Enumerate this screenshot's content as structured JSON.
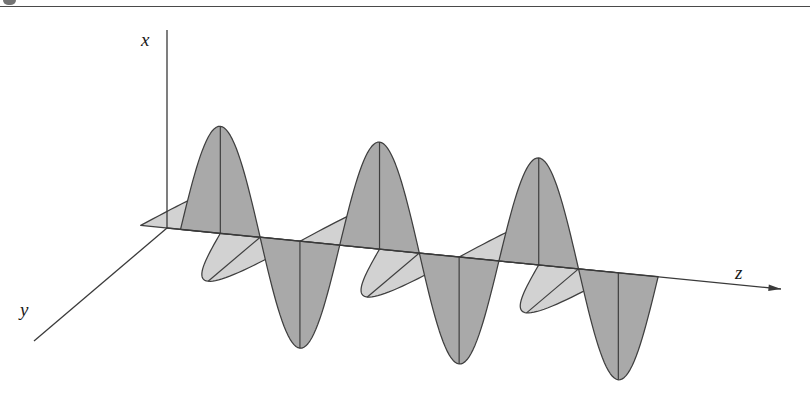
{
  "figure": {
    "background_color": "#ffffff",
    "width": 810,
    "height": 407,
    "top_rule": {
      "name": "page-top-rule",
      "color": "#4a4a4a",
      "y": 6,
      "thickness": 1.4
    },
    "corner_mark": {
      "name": "page-corner-mark",
      "color": "#5c5c5c"
    }
  },
  "axes": {
    "origin": {
      "x": 167,
      "y": 228
    },
    "stroke_color": "#3a3a3a",
    "stroke_width": 1.3,
    "x_axis": {
      "label": "x",
      "from": {
        "x": 167,
        "y": 228
      },
      "to": {
        "x": 167,
        "y": 30
      },
      "arrow": false
    },
    "y_axis": {
      "label": "y",
      "from": {
        "x": 167,
        "y": 228
      },
      "to": {
        "x": 34,
        "y": 341
      },
      "arrow": false
    },
    "z_axis": {
      "label": "z",
      "from": {
        "x": 167,
        "y": 228
      },
      "to": {
        "x": 781,
        "y": 289
      },
      "arrow": true
    }
  },
  "chart_data": {
    "type": "line",
    "xlabel": "z",
    "ylabel": "x",
    "zlabel": "y",
    "grid": false,
    "legend": "none",
    "projection": {
      "z_origin_x": 167,
      "z_origin_y": 228,
      "z_step_per_unit": 79.6,
      "z_drop_per_unit": 7.9,
      "y_dx": -52.0,
      "y_dy": 44.0
    },
    "wavelength_units": 2,
    "z_range_units": [
      0,
      6
    ],
    "series": [
      {
        "name": "x-polarized component",
        "plane": "xz",
        "fill": "#a9a9a9",
        "stroke": "#3f3f3f",
        "amplitude_px": 107,
        "phase_units": 0,
        "lobes": [
          {
            "index": 0,
            "sign": "up",
            "center_z_units": 0.67,
            "peak": {
              "x": 220,
              "y": 122
            }
          },
          {
            "index": 1,
            "sign": "down",
            "center_z_units": 1.67,
            "peak": {
              "x": 291,
              "y": 354
            }
          },
          {
            "index": 2,
            "sign": "up",
            "center_z_units": 2.67,
            "peak": {
              "x": 382,
              "y": 168
            }
          },
          {
            "index": 3,
            "sign": "down",
            "center_z_units": 3.67,
            "peak": {
              "x": 448,
              "y": 390
            }
          },
          {
            "index": 4,
            "sign": "up",
            "center_z_units": 4.67,
            "peak": {
              "x": 542,
              "y": 208
            }
          },
          {
            "index": 5,
            "sign": "down",
            "center_z_units": 5.67,
            "peak": {
              "x": 608,
              "y": 398
            }
          }
        ]
      },
      {
        "name": "y-polarized component",
        "plane": "yz",
        "fill": "#d2d2d2",
        "stroke": "#3f3f3f",
        "amplitude_units": 1.0,
        "phase_units": 1.0,
        "lobes": [
          {
            "index": 0,
            "sign": "minus-y",
            "center_z_units": 0.17
          },
          {
            "index": 1,
            "sign": "plus-y",
            "center_z_units": 1.17
          },
          {
            "index": 2,
            "sign": "minus-y",
            "center_z_units": 2.17
          },
          {
            "index": 3,
            "sign": "plus-y",
            "center_z_units": 3.17
          },
          {
            "index": 4,
            "sign": "minus-y",
            "center_z_units": 4.17
          },
          {
            "index": 5,
            "sign": "plus-y",
            "center_z_units": 5.17
          }
        ]
      }
    ],
    "zero_crossings_px": [
      167,
      247,
      326,
      406,
      486,
      565,
      645
    ]
  }
}
